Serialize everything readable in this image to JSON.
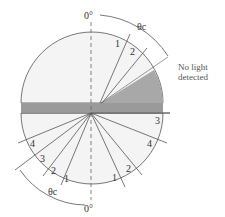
{
  "figure": {
    "top_angle_label": "0°",
    "bottom_angle_label": "0°",
    "critical_angle_top": "θc",
    "critical_angle_bottom": "θc",
    "annotation": [
      "No light",
      "detected"
    ],
    "top_ray_labels": [
      "1",
      "2"
    ],
    "bottom_left_ray_labels": [
      "4",
      "3",
      "2",
      "1"
    ],
    "bottom_right_ray_labels": [
      "1",
      "2",
      "4",
      "3"
    ],
    "colors": {
      "semicircle_fill": "#f4f4f4",
      "band": "#9a9a9a",
      "shadow": "#a8a8a8",
      "line": "#555555"
    }
  }
}
